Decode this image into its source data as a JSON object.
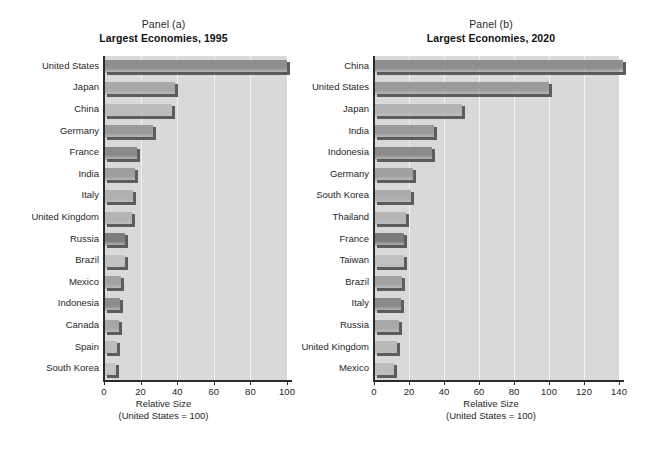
{
  "figure": {
    "background": "#ffffff",
    "plot_background": "#d9d9d9",
    "gridline_color": "#f2f2f2",
    "axis_color": "#2b2b2b"
  },
  "panels": [
    {
      "letter": "Panel (a)",
      "title": "Largest Economies, 1995",
      "axis_label_line1": "Relative Size",
      "axis_label_line2": "(United States = 100)"
    },
    {
      "letter": "Panel (b)",
      "title": "Largest Economies, 2020",
      "axis_label_line1": "Relative Size",
      "axis_label_line2": "(United States = 100)"
    }
  ],
  "chart_data": [
    {
      "type": "bar",
      "orientation": "horizontal",
      "title": "Largest Economies, 1995",
      "subtitle": "Panel (a)",
      "xlabel": "Relative Size (United States = 100)",
      "ylabel": "",
      "xlim": [
        0,
        100
      ],
      "xticks": [
        0,
        20,
        40,
        60,
        80,
        100
      ],
      "grid": true,
      "legend": "none",
      "categories": [
        "United States",
        "Japan",
        "China",
        "Germany",
        "France",
        "India",
        "Italy",
        "United Kingdom",
        "Russia",
        "Brazil",
        "Mexico",
        "Indonesia",
        "Canada",
        "Spain",
        "South Korea"
      ],
      "values": [
        100,
        39,
        37,
        27,
        18,
        17,
        16,
        15.5,
        11.5,
        11.5,
        9.5,
        9,
        8,
        7,
        6.5
      ],
      "bar_colors": [
        "#8e8e8e",
        "#a8a8a8",
        "#bcbcbc",
        "#9a9a9a",
        "#8a8a8a",
        "#9d9d9d",
        "#b0b0b0",
        "#b4b4b4",
        "#7d7d7d",
        "#c2c2c2",
        "#a2a2a2",
        "#8d8d8d",
        "#a6a6a6",
        "#bdbdbd",
        "#c4c4c4"
      ]
    },
    {
      "type": "bar",
      "orientation": "horizontal",
      "title": "Largest Economies, 2020",
      "subtitle": "Panel (b)",
      "xlabel": "Relative Size (United States = 100)",
      "ylabel": "",
      "xlim": [
        0,
        140
      ],
      "xticks": [
        0,
        20,
        40,
        60,
        80,
        100,
        120,
        140
      ],
      "grid": true,
      "legend": "none",
      "categories": [
        "China",
        "United States",
        "Japan",
        "India",
        "Indonesia",
        "Germany",
        "South Korea",
        "Thailand",
        "France",
        "Taiwan",
        "Brazil",
        "Italy",
        "Russia",
        "United Kingdom",
        "Mexico"
      ],
      "values": [
        142,
        100,
        50,
        34,
        33,
        22,
        21,
        18,
        17,
        17,
        16,
        15.5,
        14,
        13,
        11.5
      ],
      "bar_colors": [
        "#8e8e8e",
        "#9b9b9b",
        "#b4b4b4",
        "#9a9a9a",
        "#8b8b8b",
        "#a0a0a0",
        "#ababab",
        "#b6b6b6",
        "#7c7c7c",
        "#c0c0c0",
        "#a4a4a4",
        "#8a8a8a",
        "#a8a8a8",
        "#b8b8b8",
        "#bdbdbd"
      ]
    }
  ]
}
